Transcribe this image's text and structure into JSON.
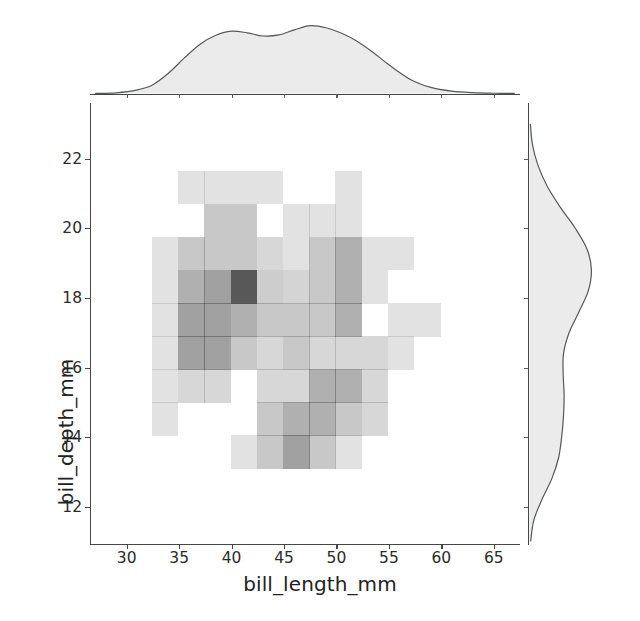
{
  "figure": {
    "kind": "seaborn-jointplot",
    "background": "#ffffff",
    "hist_color": "#4a4a4a",
    "kde_fill": "#ebebeb",
    "kde_line": "#555759",
    "axis_color": "#444648"
  },
  "axes": {
    "x_title": "bill_length_mm",
    "y_title": "bill_depth_mm",
    "x_ticks": [
      30,
      35,
      40,
      45,
      50,
      55,
      60,
      65
    ],
    "x_tick_labels": [
      "30",
      "35",
      "40",
      "45",
      "50",
      "55",
      "60",
      "65"
    ],
    "y_ticks": [
      12,
      14,
      16,
      18,
      20,
      22
    ],
    "y_tick_labels": [
      "12",
      "14",
      "16",
      "18",
      "20",
      "22"
    ],
    "xlim": [
      26.5,
      67.5
    ],
    "ylim": [
      10.9,
      23.6
    ]
  },
  "chart_data": {
    "type": "heatmap",
    "title": "",
    "xlabel": "bill_length_mm",
    "ylabel": "bill_depth_mm",
    "xlim": [
      26.5,
      67.5
    ],
    "ylim": [
      10.9,
      23.6
    ],
    "grid": false,
    "legend": null,
    "colormap": "greys",
    "max_count": 1.0,
    "x_bin_edges": [
      32.5,
      35.0,
      37.5,
      40.0,
      42.5,
      45.0,
      47.5,
      50.0,
      52.5,
      55.0,
      57.5,
      60.0
    ],
    "y_bin_edges": [
      13.1,
      14.05,
      15.0,
      15.95,
      16.9,
      17.85,
      18.8,
      19.75,
      20.7,
      21.65
    ],
    "cells": [
      {
        "x0": 34.9,
        "x1": 37.4,
        "y0": 20.7,
        "y1": 21.65,
        "v": 0.16
      },
      {
        "x0": 37.4,
        "x1": 39.9,
        "y0": 20.7,
        "y1": 21.65,
        "v": 0.16
      },
      {
        "x0": 39.9,
        "x1": 42.4,
        "y0": 20.7,
        "y1": 21.65,
        "v": 0.16
      },
      {
        "x0": 42.4,
        "x1": 44.9,
        "y0": 20.7,
        "y1": 21.65,
        "v": 0.16
      },
      {
        "x0": 49.9,
        "x1": 52.4,
        "y0": 20.7,
        "y1": 21.65,
        "v": 0.16
      },
      {
        "x0": 37.4,
        "x1": 39.9,
        "y0": 19.75,
        "y1": 20.7,
        "v": 0.3
      },
      {
        "x0": 39.9,
        "x1": 42.4,
        "y0": 19.75,
        "y1": 20.7,
        "v": 0.3
      },
      {
        "x0": 44.9,
        "x1": 47.4,
        "y0": 19.75,
        "y1": 20.7,
        "v": 0.16
      },
      {
        "x0": 47.4,
        "x1": 49.9,
        "y0": 19.75,
        "y1": 20.7,
        "v": 0.16
      },
      {
        "x0": 49.9,
        "x1": 52.4,
        "y0": 19.75,
        "y1": 20.7,
        "v": 0.16
      },
      {
        "x0": 32.4,
        "x1": 34.9,
        "y0": 18.8,
        "y1": 19.75,
        "v": 0.16
      },
      {
        "x0": 34.9,
        "x1": 37.4,
        "y0": 18.8,
        "y1": 19.75,
        "v": 0.3
      },
      {
        "x0": 37.4,
        "x1": 39.9,
        "y0": 18.8,
        "y1": 19.75,
        "v": 0.3
      },
      {
        "x0": 39.9,
        "x1": 42.4,
        "y0": 18.8,
        "y1": 19.75,
        "v": 0.3
      },
      {
        "x0": 42.4,
        "x1": 44.9,
        "y0": 18.8,
        "y1": 19.75,
        "v": 0.22
      },
      {
        "x0": 44.9,
        "x1": 47.4,
        "y0": 18.8,
        "y1": 19.75,
        "v": 0.16
      },
      {
        "x0": 47.4,
        "x1": 49.9,
        "y0": 18.8,
        "y1": 19.75,
        "v": 0.3
      },
      {
        "x0": 49.9,
        "x1": 52.4,
        "y0": 18.8,
        "y1": 19.75,
        "v": 0.44
      },
      {
        "x0": 52.4,
        "x1": 54.9,
        "y0": 18.8,
        "y1": 19.75,
        "v": 0.16
      },
      {
        "x0": 54.9,
        "x1": 57.4,
        "y0": 18.8,
        "y1": 19.75,
        "v": 0.16
      },
      {
        "x0": 32.4,
        "x1": 34.9,
        "y0": 17.85,
        "y1": 18.8,
        "v": 0.16
      },
      {
        "x0": 34.9,
        "x1": 37.4,
        "y0": 17.85,
        "y1": 18.8,
        "v": 0.44
      },
      {
        "x0": 37.4,
        "x1": 39.9,
        "y0": 17.85,
        "y1": 18.8,
        "v": 0.52
      },
      {
        "x0": 39.9,
        "x1": 42.4,
        "y0": 17.85,
        "y1": 18.8,
        "v": 0.92
      },
      {
        "x0": 42.4,
        "x1": 44.9,
        "y0": 17.85,
        "y1": 18.8,
        "v": 0.28
      },
      {
        "x0": 44.9,
        "x1": 47.4,
        "y0": 17.85,
        "y1": 18.8,
        "v": 0.24
      },
      {
        "x0": 47.4,
        "x1": 49.9,
        "y0": 17.85,
        "y1": 18.8,
        "v": 0.3
      },
      {
        "x0": 49.9,
        "x1": 52.4,
        "y0": 17.85,
        "y1": 18.8,
        "v": 0.44
      },
      {
        "x0": 52.4,
        "x1": 54.9,
        "y0": 17.85,
        "y1": 18.8,
        "v": 0.16
      },
      {
        "x0": 32.4,
        "x1": 34.9,
        "y0": 16.9,
        "y1": 17.85,
        "v": 0.16
      },
      {
        "x0": 34.9,
        "x1": 37.4,
        "y0": 16.9,
        "y1": 17.85,
        "v": 0.52
      },
      {
        "x0": 37.4,
        "x1": 39.9,
        "y0": 16.9,
        "y1": 17.85,
        "v": 0.52
      },
      {
        "x0": 39.9,
        "x1": 42.4,
        "y0": 16.9,
        "y1": 17.85,
        "v": 0.44
      },
      {
        "x0": 42.4,
        "x1": 44.9,
        "y0": 16.9,
        "y1": 17.85,
        "v": 0.3
      },
      {
        "x0": 44.9,
        "x1": 47.4,
        "y0": 16.9,
        "y1": 17.85,
        "v": 0.3
      },
      {
        "x0": 47.4,
        "x1": 49.9,
        "y0": 16.9,
        "y1": 17.85,
        "v": 0.3
      },
      {
        "x0": 49.9,
        "x1": 52.4,
        "y0": 16.9,
        "y1": 17.85,
        "v": 0.44
      },
      {
        "x0": 54.9,
        "x1": 57.4,
        "y0": 16.9,
        "y1": 17.85,
        "v": 0.16
      },
      {
        "x0": 57.4,
        "x1": 59.9,
        "y0": 16.9,
        "y1": 17.85,
        "v": 0.16
      },
      {
        "x0": 32.4,
        "x1": 34.9,
        "y0": 15.95,
        "y1": 16.9,
        "v": 0.16
      },
      {
        "x0": 34.9,
        "x1": 37.4,
        "y0": 15.95,
        "y1": 16.9,
        "v": 0.52
      },
      {
        "x0": 37.4,
        "x1": 39.9,
        "y0": 15.95,
        "y1": 16.9,
        "v": 0.52
      },
      {
        "x0": 39.9,
        "x1": 42.4,
        "y0": 15.95,
        "y1": 16.9,
        "v": 0.3
      },
      {
        "x0": 42.4,
        "x1": 44.9,
        "y0": 15.95,
        "y1": 16.9,
        "v": 0.22
      },
      {
        "x0": 44.9,
        "x1": 47.4,
        "y0": 15.95,
        "y1": 16.9,
        "v": 0.3
      },
      {
        "x0": 47.4,
        "x1": 49.9,
        "y0": 15.95,
        "y1": 16.9,
        "v": 0.22
      },
      {
        "x0": 49.9,
        "x1": 52.4,
        "y0": 15.95,
        "y1": 16.9,
        "v": 0.22
      },
      {
        "x0": 52.4,
        "x1": 54.9,
        "y0": 15.95,
        "y1": 16.9,
        "v": 0.22
      },
      {
        "x0": 54.9,
        "x1": 57.4,
        "y0": 15.95,
        "y1": 16.9,
        "v": 0.16
      },
      {
        "x0": 32.4,
        "x1": 34.9,
        "y0": 15.0,
        "y1": 15.95,
        "v": 0.16
      },
      {
        "x0": 34.9,
        "x1": 37.4,
        "y0": 15.0,
        "y1": 15.95,
        "v": 0.22
      },
      {
        "x0": 37.4,
        "x1": 39.9,
        "y0": 15.0,
        "y1": 15.95,
        "v": 0.22
      },
      {
        "x0": 42.4,
        "x1": 44.9,
        "y0": 15.0,
        "y1": 15.95,
        "v": 0.22
      },
      {
        "x0": 44.9,
        "x1": 47.4,
        "y0": 15.0,
        "y1": 15.95,
        "v": 0.22
      },
      {
        "x0": 47.4,
        "x1": 49.9,
        "y0": 15.0,
        "y1": 15.95,
        "v": 0.44
      },
      {
        "x0": 49.9,
        "x1": 52.4,
        "y0": 15.0,
        "y1": 15.95,
        "v": 0.44
      },
      {
        "x0": 52.4,
        "x1": 54.9,
        "y0": 15.0,
        "y1": 15.95,
        "v": 0.22
      },
      {
        "x0": 32.4,
        "x1": 34.9,
        "y0": 14.05,
        "y1": 15.0,
        "v": 0.16
      },
      {
        "x0": 42.4,
        "x1": 44.9,
        "y0": 14.05,
        "y1": 15.0,
        "v": 0.3
      },
      {
        "x0": 44.9,
        "x1": 47.4,
        "y0": 14.05,
        "y1": 15.0,
        "v": 0.44
      },
      {
        "x0": 47.4,
        "x1": 49.9,
        "y0": 14.05,
        "y1": 15.0,
        "v": 0.44
      },
      {
        "x0": 49.9,
        "x1": 52.4,
        "y0": 14.05,
        "y1": 15.0,
        "v": 0.3
      },
      {
        "x0": 52.4,
        "x1": 54.9,
        "y0": 14.05,
        "y1": 15.0,
        "v": 0.22
      },
      {
        "x0": 39.9,
        "x1": 42.4,
        "y0": 13.1,
        "y1": 14.05,
        "v": 0.16
      },
      {
        "x0": 42.4,
        "x1": 44.9,
        "y0": 13.1,
        "y1": 14.05,
        "v": 0.3
      },
      {
        "x0": 44.9,
        "x1": 47.4,
        "y0": 13.1,
        "y1": 14.05,
        "v": 0.52
      },
      {
        "x0": 47.4,
        "x1": 49.9,
        "y0": 13.1,
        "y1": 14.05,
        "v": 0.3
      },
      {
        "x0": 49.9,
        "x1": 52.4,
        "y0": 13.1,
        "y1": 14.05,
        "v": 0.16
      }
    ],
    "marginal_x": {
      "type": "kde",
      "variable": "bill_length_mm",
      "description": "bimodal density with peaks near 40 and 47",
      "x": [
        27,
        29,
        31,
        32.5,
        34,
        35.5,
        37,
        38.5,
        40,
        41.5,
        43,
        44.5,
        46,
        47.5,
        49,
        50.5,
        52,
        53.5,
        55,
        57,
        59,
        61,
        63,
        65,
        67
      ],
      "density": [
        0.004,
        0.012,
        0.055,
        0.13,
        0.3,
        0.52,
        0.72,
        0.85,
        0.91,
        0.885,
        0.84,
        0.855,
        0.93,
        0.99,
        0.96,
        0.88,
        0.76,
        0.6,
        0.42,
        0.21,
        0.09,
        0.035,
        0.013,
        0.005,
        0.002
      ]
    },
    "marginal_y": {
      "type": "kde",
      "variable": "bill_depth_mm",
      "description": "right-skewed density, main peak near 18.6 with a shoulder near 15",
      "y": [
        11.0,
        11.6,
        12.2,
        12.8,
        13.4,
        14.0,
        14.6,
        15.2,
        15.8,
        16.4,
        17.0,
        17.6,
        18.2,
        18.8,
        19.4,
        20.0,
        20.6,
        21.2,
        21.8,
        22.4,
        23.0
      ],
      "density": [
        0.02,
        0.07,
        0.2,
        0.36,
        0.47,
        0.52,
        0.55,
        0.56,
        0.545,
        0.55,
        0.64,
        0.8,
        0.95,
        1.0,
        0.93,
        0.74,
        0.5,
        0.29,
        0.14,
        0.05,
        0.015
      ]
    }
  }
}
